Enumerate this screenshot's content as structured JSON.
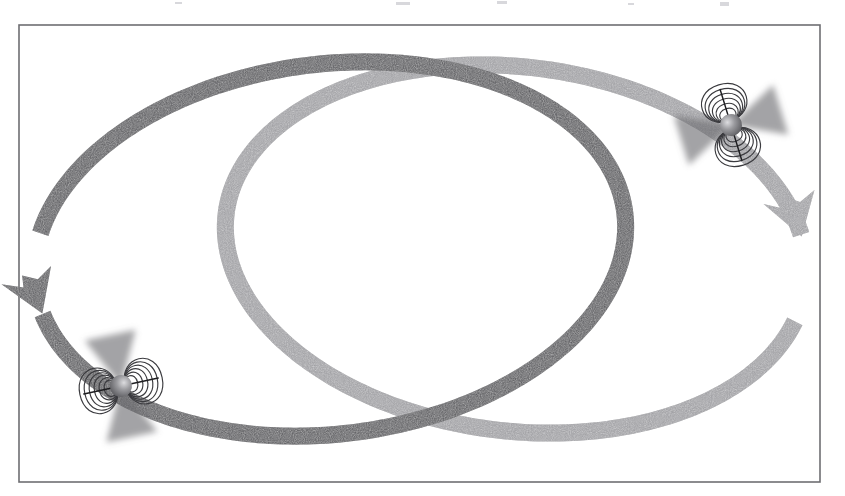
{
  "figure": {
    "title": "Binary pulsar system: two neutron stars on interlocking orbits",
    "caption": "",
    "background_color": "#ffffff",
    "frame": {
      "name": "figure-border",
      "x": 19,
      "y": 25,
      "width": 801,
      "height": 457,
      "stroke_color": "#6e6e72",
      "stroke_width": 1.6
    }
  },
  "colors": {
    "orbit_dark": "#58585c",
    "orbit_light": "#9d9da1",
    "field_line": "#3b3b3f",
    "axis_line": "#1d1d20",
    "beam_dark": "#6a6a6e",
    "beam_light": "#b4b4b8",
    "star_body": "#7a7a7e",
    "star_highlight": "#d5d5d8",
    "frame": "#6e6e72",
    "page": "#ffffff"
  },
  "orbits": [
    {
      "name": "orbit-dark",
      "label": "Dark orbit (front star path)",
      "tone": "dark",
      "color": "#58585c",
      "center_x": 330,
      "center_y": 249,
      "radius_x": 297,
      "radius_y": 185,
      "rotation_deg": -7,
      "band_width": 17,
      "direction": "counter-clockwise",
      "arrow": {
        "name": "orbit-dark-arrowhead",
        "position": "top-left",
        "points_toward": "left-down",
        "tip_x": 131,
        "tip_y": 96
      },
      "gap": {
        "start_deg": 171,
        "end_deg": 196
      },
      "z_order": "over-at-crossings"
    },
    {
      "name": "orbit-light",
      "label": "Light orbit (back star path)",
      "tone": "light",
      "color": "#9d9da1",
      "center_x": 516,
      "center_y": 249,
      "radius_x": 292,
      "radius_y": 182,
      "rotation_deg": 7,
      "band_width": 17,
      "direction": "clockwise",
      "arrow": {
        "name": "orbit-light-arrowhead",
        "position": "bottom-right",
        "points_toward": "right-up",
        "tip_x": 703,
        "tip_y": 404
      },
      "gap": {
        "start_deg": -15,
        "end_deg": 12
      },
      "z_order": "under-at-crossings"
    }
  ],
  "neutron_stars": [
    {
      "name": "neutron-star-upper-right",
      "label": "Magnetized neutron star (upper right)",
      "center_x": 731,
      "center_y": 125,
      "sphere_radius": 11,
      "axis_tilt_deg": -17,
      "axis_length": 74,
      "field_loop_count": 6,
      "field_loop_orientation": "loops above and below the magnetic axis",
      "beam_orientation": "beams along the magnetic equator (left and right)",
      "sits_on_orbit": "both"
    },
    {
      "name": "neutron-star-lower-left",
      "label": "Magnetized neutron star (lower left)",
      "center_x": 121,
      "center_y": 386,
      "sphere_radius": 11,
      "axis_tilt_deg": 78,
      "axis_length": 76,
      "field_loop_count": 6,
      "field_loop_orientation": "loops left and right of the magnetic axis",
      "beam_orientation": "beams along the magnetic equator (up and down)",
      "sits_on_orbit": "both"
    }
  ],
  "crossings": [
    {
      "name": "orbit-crossing-top",
      "x": 424,
      "y": 72,
      "over": "orbit-dark"
    },
    {
      "name": "orbit-crossing-bottom",
      "x": 424,
      "y": 426,
      "over": "orbit-dark"
    }
  ],
  "scan_artifacts": [
    {
      "name": "scan-speck",
      "x": 396,
      "y": 2,
      "width": 14,
      "height": 3
    },
    {
      "name": "scan-speck",
      "x": 497,
      "y": 1,
      "width": 10,
      "height": 3
    },
    {
      "name": "scan-speck",
      "x": 720,
      "y": 2,
      "width": 9,
      "height": 4
    },
    {
      "name": "scan-speck",
      "x": 175,
      "y": 2,
      "width": 7,
      "height": 2
    },
    {
      "name": "scan-speck",
      "x": 628,
      "y": 3,
      "width": 6,
      "height": 2
    }
  ]
}
